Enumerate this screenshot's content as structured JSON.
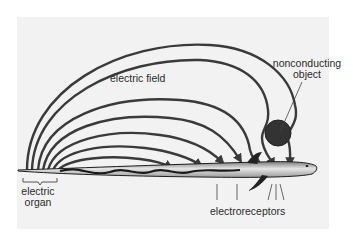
{
  "diagram": {
    "labels": {
      "electric_field": "electric field",
      "nonconducting_object_line1": "nonconducting",
      "nonconducting_object_line2": "object",
      "electric_organ_line1": "electric",
      "electric_organ_line2": "organ",
      "electroreceptors": "electroreceptors"
    },
    "colors": {
      "background": "#ffffff",
      "panel": "#f2f2f2",
      "field_lines": "#3a3a3a",
      "object": "#333333",
      "fish_body": "#c8c8c8",
      "text": "#2a2a2a"
    },
    "field_line_count": 8
  }
}
